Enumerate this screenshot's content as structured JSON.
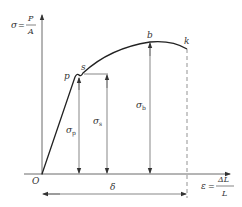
{
  "diagram": {
    "y_axis": {
      "symbol": "σ",
      "eq": "=",
      "num": "P",
      "den": "A"
    },
    "x_axis": {
      "symbol": "ε",
      "eq": "=",
      "num": "ΔL",
      "den": "L"
    },
    "origin_label": "O",
    "points": {
      "p": "p",
      "s": "s",
      "b": "b",
      "k": "k"
    },
    "stresses": {
      "sigma_p": {
        "symbol": "σ",
        "sub": "p"
      },
      "sigma_s": {
        "symbol": "σ",
        "sub": "s"
      },
      "sigma_b": {
        "symbol": "σ",
        "sub": "b"
      }
    },
    "elongation_label": "δ",
    "colors": {
      "line": "#333333",
      "thin": "#555555",
      "background": "#ffffff"
    }
  }
}
